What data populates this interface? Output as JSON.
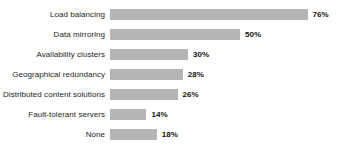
{
  "chart_data": {
    "type": "bar",
    "orientation": "horizontal",
    "title": "",
    "subtitle": "",
    "xlabel": "",
    "ylabel": "",
    "xlim": [
      0,
      80
    ],
    "grid": false,
    "legend": false,
    "axis_line": false,
    "tick_labels": [],
    "value_label_suffix": "%",
    "bar_color": "#b5b5b5",
    "label_color": "#1c1c1c",
    "value_color": "#111111",
    "categories": [
      "Load balancing",
      "Data mirroring",
      "Availability clusters",
      "Geographical redundancy",
      "Distributed content solutions",
      "Fault-tolerant servers",
      "None"
    ],
    "values": [
      76,
      50,
      30,
      28,
      26,
      14,
      18
    ],
    "value_labels": [
      "76%",
      "50%",
      "30%",
      "28%",
      "26%",
      "14%",
      "18%"
    ]
  },
  "scale": {
    "px_per_unit": 2.6
  }
}
